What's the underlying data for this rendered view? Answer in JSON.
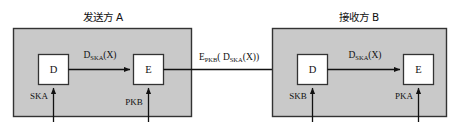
{
  "diagram": {
    "type": "cryptography-flow-diagram",
    "colors": {
      "panel_fill": "#c9c9c9",
      "panel_stroke": "#333333",
      "box_fill": "#ffffff",
      "box_stroke": "#333333",
      "line": "#111111",
      "background": "#ffffff",
      "text": "#111111"
    },
    "panels": [
      {
        "id": "sender",
        "title": "发送方 A",
        "boxes": [
          {
            "id": "sender-decrypt",
            "label": "D"
          },
          {
            "id": "sender-encrypt",
            "label": "E"
          }
        ],
        "flow_label": {
          "base": "D",
          "sub": "SKA",
          "arg": "(X)",
          "full": "DSKA(X)"
        },
        "keys": [
          {
            "id": "sender-key-ska",
            "label": "SKA",
            "target": "sender-decrypt"
          },
          {
            "id": "sender-key-pkb",
            "label": "PKB",
            "target": "sender-encrypt"
          }
        ]
      },
      {
        "id": "receiver",
        "title": "接收方 B",
        "boxes": [
          {
            "id": "receiver-decrypt",
            "label": "D"
          },
          {
            "id": "receiver-encrypt",
            "label": "E"
          }
        ],
        "flow_label": {
          "base": "D",
          "sub": "SKA",
          "arg": "(X)",
          "full": "DSKA(X)"
        },
        "keys": [
          {
            "id": "receiver-key-skb",
            "label": "SKB",
            "target": "receiver-decrypt"
          },
          {
            "id": "receiver-key-pka",
            "label": "PKA",
            "target": "receiver-encrypt"
          }
        ]
      }
    ],
    "channel": {
      "id": "channel-label",
      "base": "E",
      "sub": "PKB",
      "open": "( D",
      "sub2": "SKA",
      "close": "(X))",
      "full": "EPKB( DSKA(X))"
    }
  }
}
